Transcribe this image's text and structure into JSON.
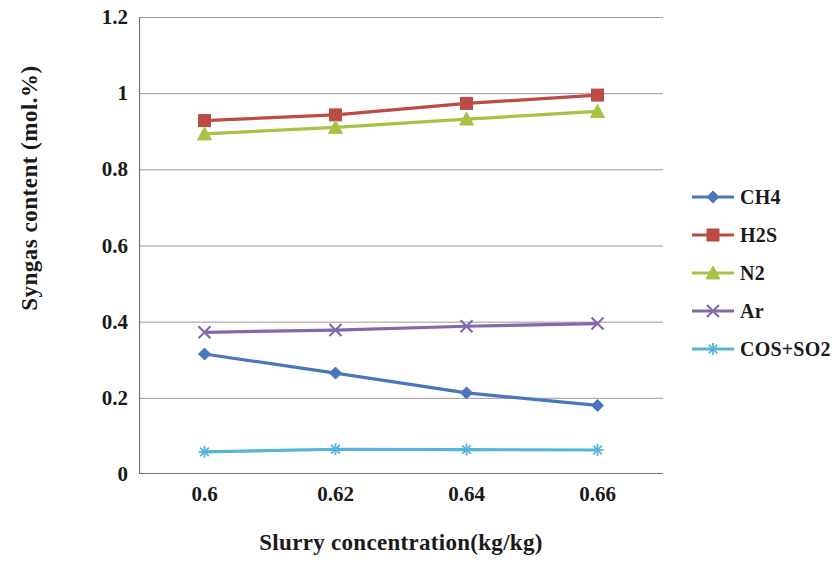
{
  "chart_data": {
    "type": "line",
    "title": "",
    "xlabel": "Slurry concentration(kg/kg)",
    "ylabel": "Syngas content (mol.%)",
    "categories": [
      "0.6",
      "0.62",
      "0.64",
      "0.66"
    ],
    "x": [
      0.6,
      0.62,
      0.64,
      0.66
    ],
    "ylim": [
      0,
      1.2
    ],
    "yticks": [
      "0",
      "0.2",
      "0.4",
      "0.6",
      "0.8",
      "1",
      "1.2"
    ],
    "ytick_values": [
      0,
      0.2,
      0.4,
      0.6,
      0.8,
      1.0,
      1.2
    ],
    "grid": true,
    "legend_position": "right",
    "series": [
      {
        "name": "CH4",
        "color": "#4A76BE",
        "marker": "diamond",
        "values": [
          0.315,
          0.265,
          0.213,
          0.18
        ]
      },
      {
        "name": "H2S",
        "color": "#BC4B43",
        "marker": "square",
        "values": [
          0.928,
          0.943,
          0.973,
          0.995
        ]
      },
      {
        "name": "N2",
        "color": "#A7C344",
        "marker": "triangle",
        "values": [
          0.893,
          0.91,
          0.932,
          0.952
        ]
      },
      {
        "name": "Ar",
        "color": "#8468AC",
        "marker": "x",
        "values": [
          0.372,
          0.378,
          0.388,
          0.395
        ]
      },
      {
        "name": "COS+SO2",
        "color": "#56B4D8",
        "marker": "asterisk",
        "values": [
          0.058,
          0.065,
          0.064,
          0.063
        ]
      }
    ]
  },
  "axes": {
    "y_title": "Syngas content (mol.%)",
    "x_title": "Slurry concentration(kg/kg)",
    "y_ticks": [
      "1.2",
      "1",
      "0.8",
      "0.6",
      "0.4",
      "0.2",
      "0"
    ],
    "x_ticks": [
      "0.6",
      "0.62",
      "0.64",
      "0.66"
    ]
  },
  "legend": {
    "items": [
      {
        "label": "CH4"
      },
      {
        "label": "H2S"
      },
      {
        "label": "N2"
      },
      {
        "label": "Ar"
      },
      {
        "label": "COS+SO2"
      }
    ]
  },
  "style": {
    "grid_color": "#8a8a8a",
    "axis_color": "#6f6f6f",
    "background": "#ffffff",
    "text_color": "#111111"
  }
}
